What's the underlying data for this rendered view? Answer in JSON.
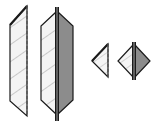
{
  "figure": {
    "width": 155,
    "height": 125,
    "background": "#ffffff",
    "colors": {
      "stroke": "#1a1a1a",
      "light_fill": "#f4f4f4",
      "hatch": "#c8c8c8",
      "dark_fill": "#8c8c8c",
      "dash": "#555555"
    },
    "shapes": [
      {
        "id": "tall-half-panel",
        "kind": "half-hexagon-hatched-dashed-edge"
      },
      {
        "id": "tall-split-panel",
        "kind": "hexagon-split-light-dark-center-bar"
      },
      {
        "id": "small-half-diamond",
        "kind": "triangle-hatched-dashed-edge"
      },
      {
        "id": "small-split-diamond",
        "kind": "diamond-split-light-dark-center-bar"
      }
    ]
  }
}
